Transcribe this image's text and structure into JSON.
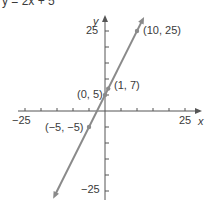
{
  "chart_data": {
    "type": "line",
    "title": "y = 2x + 5",
    "xlabel": "x",
    "ylabel": "y",
    "xlim": [
      -25,
      25
    ],
    "ylim": [
      -25,
      25
    ],
    "x_tick_step": 5,
    "y_tick_step": 5,
    "x_tick_labels": [
      "-25",
      "25"
    ],
    "y_tick_labels": [
      "25",
      "-25"
    ],
    "grid": false,
    "series": [
      {
        "name": "y = 2x + 5",
        "slope": 2,
        "intercept": 5,
        "points": [
          {
            "x": -5,
            "y": -5,
            "label": "(−5, −5)"
          },
          {
            "x": 0,
            "y": 5,
            "label": "(0, 5)"
          },
          {
            "x": 1,
            "y": 7,
            "label": "(1, 7)"
          },
          {
            "x": 10,
            "y": 25,
            "label": "(10, 25)"
          }
        ]
      }
    ],
    "colors": {
      "line": "#8a8a8a",
      "axis": "#555555",
      "point": "#8a8a8a"
    }
  },
  "labels": {
    "title": "y = 2x + 5",
    "x_axis": "x",
    "y_axis": "y",
    "x_min": "−25",
    "x_max": "25",
    "y_max": "25",
    "y_min": "−25",
    "p1": "(−5, −5)",
    "p2": "(0, 5)",
    "p3": "(1, 7)",
    "p4": "(10, 25)"
  }
}
